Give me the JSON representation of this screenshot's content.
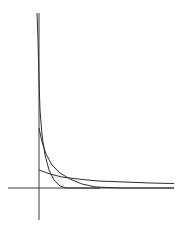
{
  "chart_data": {
    "type": "line",
    "title": "",
    "xlabel": "",
    "ylabel": "",
    "grid": false,
    "legend": null,
    "axes": {
      "origin_px": [
        39,
        188
      ],
      "x_axis_px": [
        8,
        174
      ],
      "y_axis_px": [
        13,
        220
      ]
    },
    "series": [
      {
        "name": "curve-steep",
        "description": "steepest decaying curve, starts near top of y-axis",
        "points_px": [
          [
            37,
            13
          ],
          [
            38,
            40
          ],
          [
            39,
            80
          ],
          [
            40,
            110
          ],
          [
            42,
            135
          ],
          [
            45,
            155
          ],
          [
            49,
            170
          ],
          [
            54,
            180
          ],
          [
            60,
            186
          ],
          [
            66,
            188
          ],
          [
            100,
            188
          ]
        ]
      },
      {
        "name": "curve-medium",
        "description": "moderately decaying curve",
        "points_px": [
          [
            39,
            128
          ],
          [
            42,
            142
          ],
          [
            46,
            154
          ],
          [
            52,
            165
          ],
          [
            60,
            173
          ],
          [
            70,
            179
          ],
          [
            82,
            184
          ],
          [
            96,
            187
          ],
          [
            120,
            188
          ],
          [
            174,
            188
          ]
        ]
      },
      {
        "name": "curve-shallow",
        "description": "slowly decaying curve",
        "points_px": [
          [
            39,
            170
          ],
          [
            50,
            174
          ],
          [
            62,
            177
          ],
          [
            78,
            179
          ],
          [
            98,
            181
          ],
          [
            125,
            182
          ],
          [
            150,
            183
          ],
          [
            174,
            183.5
          ]
        ]
      }
    ]
  },
  "colors": {
    "background": "#ffffff",
    "lines": "#2e2e2e"
  }
}
